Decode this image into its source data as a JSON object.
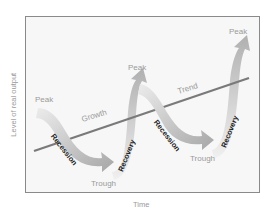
{
  "axes": {
    "y_label": "Level of real output",
    "x_label": "Time"
  },
  "labels": {
    "peak_1": "Peak",
    "peak_2": "Peak",
    "peak_3": "Peak",
    "trough_1": "Trough",
    "trough_2": "Trough",
    "growth": "Growth",
    "trend": "Trend",
    "recession_1": "Recession",
    "recession_2": "Recession",
    "recovery_1": "Recovery",
    "recovery_2": "Recovery"
  },
  "colors": {
    "frame_border": "#8a8a8a",
    "trend_line": "#7a7a7a",
    "ribbon_light": "#e6e6e6",
    "ribbon_dark": "#a8a8a8",
    "phase_text": "#222222",
    "point_text": "#9a9a9a"
  }
}
